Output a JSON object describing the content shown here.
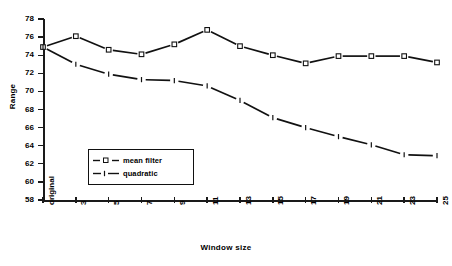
{
  "chart_data": {
    "type": "line",
    "title": "",
    "xlabel": "Window size",
    "ylabel": "Range",
    "categories": [
      "original",
      "3",
      "5",
      "7",
      "9",
      "11",
      "13",
      "15",
      "17",
      "19",
      "21",
      "23",
      "25"
    ],
    "x_tick_labels": [
      "original",
      "3",
      "5",
      "7",
      "9",
      "11",
      "13",
      "15",
      "17",
      "19",
      "21",
      "23",
      "25"
    ],
    "y_tick_labels": [
      "58",
      "60",
      "62",
      "64",
      "66",
      "68",
      "70",
      "72",
      "74",
      "76",
      "78"
    ],
    "ylim": [
      58,
      78
    ],
    "ytick_step": 2,
    "grid": false,
    "legend_position": "inside-lower-left",
    "series": [
      {
        "name": "mean filter",
        "marker": "open-square",
        "color": "#111111",
        "linestyle": "solid",
        "values": [
          74.9,
          76.1,
          74.6,
          74.1,
          75.2,
          76.8,
          75.0,
          74.0,
          73.1,
          73.9,
          73.9,
          73.9,
          73.2
        ]
      },
      {
        "name": "quadratic",
        "marker": "dash",
        "color": "#111111",
        "linestyle": "dashed",
        "values": [
          74.9,
          73.0,
          71.9,
          71.3,
          71.2,
          70.6,
          69.0,
          67.1,
          66.0,
          65.0,
          64.1,
          63.0,
          62.9
        ]
      }
    ]
  },
  "legend": {
    "items": [
      {
        "label": "mean filter"
      },
      {
        "label": "quadratic"
      }
    ]
  },
  "axes": {
    "x_title": "Window size",
    "y_title": "Range"
  }
}
